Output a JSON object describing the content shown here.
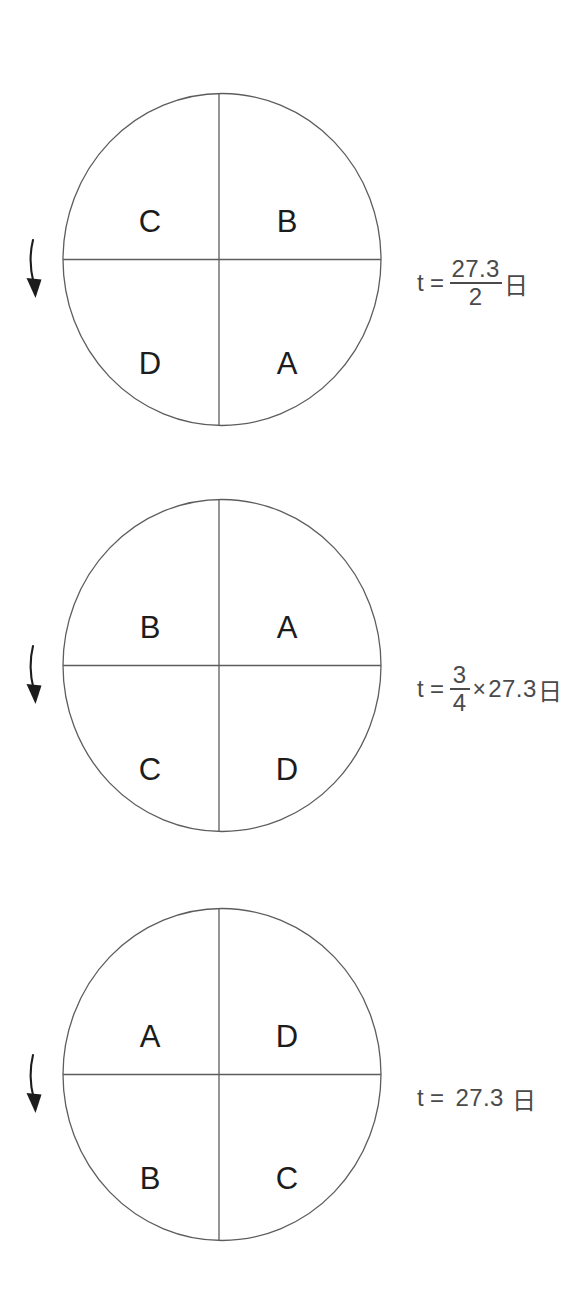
{
  "diagram": {
    "type": "quadrant-rotation-figures",
    "background_color": "#ffffff",
    "stroke_color": "#5d5d5d",
    "text_color": "#3a3a3a",
    "label_color": "#1c1c1c",
    "arrow_direction": "down",
    "arrow_icon_name": "rotation-arrow-down-icon"
  },
  "figures": [
    {
      "id": "figure-1",
      "quadrants": {
        "top_left": "C",
        "top_right": "B",
        "bottom_left": "D",
        "bottom_right": "A"
      },
      "formula": {
        "variable": "t",
        "equals": "=",
        "kind": "fraction",
        "numerator": "27.3",
        "denominator": "2",
        "unit": "日",
        "text": "t = 27.3/2 日"
      }
    },
    {
      "id": "figure-2",
      "quadrants": {
        "top_left": "B",
        "top_right": "A",
        "bottom_left": "C",
        "bottom_right": "D"
      },
      "formula": {
        "variable": "t",
        "equals": "=",
        "kind": "fraction-times",
        "numerator": "3",
        "denominator": "4",
        "times": "×",
        "factor": "27.3",
        "unit": "日",
        "text": "t = 3/4 × 27.3 日"
      }
    },
    {
      "id": "figure-3",
      "quadrants": {
        "top_left": "A",
        "top_right": "D",
        "bottom_left": "B",
        "bottom_right": "C"
      },
      "formula": {
        "variable": "t",
        "equals": "=",
        "kind": "plain",
        "value": "27.3",
        "unit": "日",
        "text": "t = 27.3 日"
      }
    }
  ]
}
